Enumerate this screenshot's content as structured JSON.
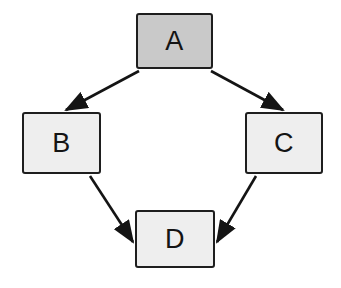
{
  "diagram": {
    "type": "flowchart",
    "title": "",
    "background_color": "#ffffff",
    "layout": "diamond",
    "edge_color": "#141414",
    "node_border_color": "#1e1e1e",
    "nodes": [
      {
        "id": "A",
        "label": "A",
        "x": 136,
        "y": 13,
        "width": 77,
        "height": 56,
        "fill": "#c9c9c9",
        "role": "start"
      },
      {
        "id": "B",
        "label": "B",
        "x": 22,
        "y": 112,
        "width": 79,
        "height": 62,
        "fill": "#eeeeee",
        "role": "branch"
      },
      {
        "id": "C",
        "label": "C",
        "x": 245,
        "y": 112,
        "width": 78,
        "height": 62,
        "fill": "#eeeeee",
        "role": "branch"
      },
      {
        "id": "D",
        "label": "D",
        "x": 135,
        "y": 210,
        "width": 80,
        "height": 58,
        "fill": "#eeeeee",
        "role": "end"
      }
    ],
    "edges": [
      {
        "id": "a-to-b",
        "from": "A",
        "to": "B",
        "label": "",
        "x1": 139,
        "y1": 71,
        "x2": 66,
        "y2": 110,
        "directed": true
      },
      {
        "id": "a-to-c",
        "from": "A",
        "to": "C",
        "label": "",
        "x1": 211,
        "y1": 71,
        "x2": 283,
        "y2": 110,
        "directed": true
      },
      {
        "id": "b-to-d",
        "from": "B",
        "to": "D",
        "label": "",
        "x1": 90,
        "y1": 176,
        "x2": 133,
        "y2": 242,
        "directed": true
      },
      {
        "id": "c-to-d",
        "from": "C",
        "to": "D",
        "label": "",
        "x1": 256,
        "y1": 176,
        "x2": 217,
        "y2": 242,
        "directed": true
      }
    ]
  }
}
